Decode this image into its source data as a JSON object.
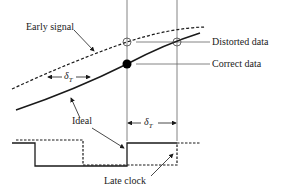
{
  "diagram": {
    "labels": {
      "early_signal": "Early signal",
      "distorted_data": "Distorted data",
      "correct_data": "Correct data",
      "ideal": "Ideal",
      "late_clock": "Late clock"
    },
    "symbols": {
      "delta": "δ",
      "delta_sub": "T"
    },
    "colors": {
      "line": "#1a1a1a",
      "guide": "#555555",
      "background": "#ffffff"
    }
  }
}
